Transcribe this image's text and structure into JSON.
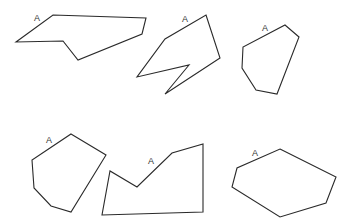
{
  "diagram": {
    "stroke_color": "#2a2a2a",
    "background": "#ffffff",
    "shapes": [
      {
        "label": "A",
        "label_pos": [
          36,
          20
        ],
        "points": "53,15 146,18 142,34 78,60 63,41 16,42"
      },
      {
        "label": "A",
        "label_pos": [
          183,
          22
        ],
        "points": "206,15 220,58 165,94 189,65 137,77 165,39"
      },
      {
        "label": "A",
        "label_pos": [
          262,
          31
        ],
        "points": "285,25 299,37 277,94 256,90 242,68 243,47"
      },
      {
        "label": "A",
        "label_pos": [
          46,
          143
        ],
        "points": "71,134 106,155 71,212 51,206 34,188 32,160"
      },
      {
        "label": "A",
        "label_pos": [
          148,
          164
        ],
        "points": "203,144 203,212 102,215 110,171 137,187 172,153"
      },
      {
        "label": "A",
        "label_pos": [
          252,
          156
        ],
        "points": "280,149 336,177 326,203 280,217 232,187 237,168"
      }
    ]
  }
}
